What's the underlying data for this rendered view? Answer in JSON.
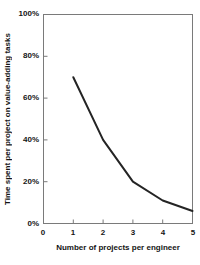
{
  "figure": {
    "background": "#ffffff",
    "axis_color": "#7a7a7a",
    "line_color": "#242424",
    "text_color": "#141414"
  },
  "chart_data": {
    "type": "line",
    "title": "",
    "xlabel": "Number of projects per engineer",
    "ylabel": "Time spent per project on value-adding tasks",
    "x": [
      1,
      2,
      3,
      4,
      5
    ],
    "y": [
      70,
      40,
      20,
      11,
      6
    ],
    "xlim": [
      0,
      5
    ],
    "ylim": [
      0,
      100
    ],
    "x_ticks": [
      0,
      1,
      2,
      3,
      4,
      5
    ],
    "x_tick_labels": [
      "0",
      "1",
      "2",
      "3",
      "4",
      "5"
    ],
    "y_ticks": [
      0,
      20,
      40,
      60,
      80,
      100
    ],
    "y_tick_labels": [
      "0%",
      "20%",
      "40%",
      "60%",
      "80%",
      "100%"
    ],
    "grid": false,
    "legend": false,
    "line_width": 2
  }
}
